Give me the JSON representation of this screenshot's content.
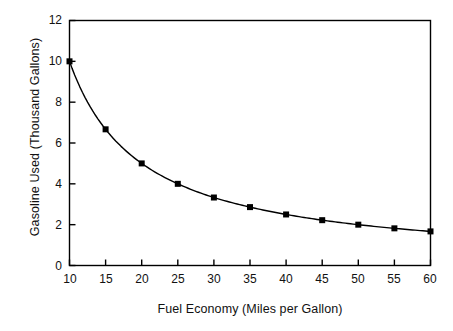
{
  "chart_data": {
    "type": "line",
    "title": "",
    "xlabel": "Fuel Economy (Miles per Gallon)",
    "ylabel": "Gasoline Used (Thousand Gallons)",
    "x": [
      10,
      15,
      20,
      25,
      30,
      35,
      40,
      45,
      50,
      55,
      60
    ],
    "values": [
      10.0,
      6.67,
      5.0,
      4.0,
      3.33,
      2.86,
      2.5,
      2.22,
      2.0,
      1.82,
      1.67
    ],
    "series": [
      {
        "name": "Gasoline Used",
        "values": [
          10.0,
          6.67,
          5.0,
          4.0,
          3.33,
          2.86,
          2.5,
          2.22,
          2.0,
          1.82,
          1.67
        ]
      }
    ],
    "xlim": [
      10,
      60
    ],
    "ylim": [
      0,
      12
    ],
    "xticks": [
      10,
      15,
      20,
      25,
      30,
      35,
      40,
      45,
      50,
      55,
      60
    ],
    "yticks": [
      0,
      2,
      4,
      6,
      8,
      10,
      12
    ],
    "xtick_labels": [
      "10",
      "15",
      "20",
      "25",
      "30",
      "35",
      "40",
      "45",
      "50",
      "55",
      "60"
    ],
    "ytick_labels": [
      "0",
      "2",
      "4",
      "6",
      "8",
      "10",
      "12"
    ],
    "grid": false,
    "legend": null,
    "marker": "filled-square",
    "line_color": "#000000",
    "marker_color": "#000000",
    "axis_color": "#000000",
    "background_color": "#ffffff"
  }
}
